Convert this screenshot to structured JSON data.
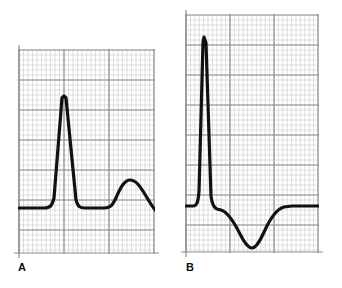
{
  "figure": {
    "background_color": "#ffffff",
    "width": 342,
    "height": 288
  },
  "style": {
    "trace_color": "#111111",
    "trace_width": 3.2,
    "grid_minor_color": "#c9c9c9",
    "grid_major_color": "#8e8e8e",
    "grid_minor_width": 0.6,
    "grid_major_width": 1.2,
    "label_color": "#111111"
  },
  "panels": [
    {
      "id": "panel-a",
      "label": "A",
      "label_x": 18,
      "label_y": 262,
      "box": {
        "x": 19,
        "y": 50,
        "width": 135,
        "height": 203
      },
      "grid": {
        "minor_step_x": 4.5,
        "minor_step_y": 5.0,
        "major_step_x": 45,
        "major_step_y": 30
      },
      "waveform": {
        "name": "normal-qrs-upright-t",
        "baseline_y": 208,
        "r_peak": {
          "x": 64,
          "y": 96
        },
        "t_peak": {
          "x": 128,
          "y": 180
        },
        "path": "M 19,208 L 44,208 C 50,208 52,206 54,198 L 62,98 L 64,96 L 66,98 L 76,200 C 78,207 80,208 85,208 L 104,208 C 110,208 112,206 116,198 C 121,186 125,180 130,180 C 136,180 140,186 146,196 C 150,203 153,208 157,212"
      }
    },
    {
      "id": "panel-b",
      "label": "B",
      "label_x": 186,
      "label_y": 262,
      "box": {
        "x": 186,
        "y": 15,
        "width": 132,
        "height": 237
      },
      "grid": {
        "minor_step_x": 4.4,
        "minor_step_y": 5.0,
        "major_step_x": 44,
        "major_step_y": 30
      },
      "waveform": {
        "name": "tall-r-wave-inverted-t",
        "baseline_y": 206,
        "r_peak": {
          "x": 204,
          "y": 37
        },
        "t_trough": {
          "x": 252,
          "y": 248
        },
        "path": "M 186,206 L 193,206 C 197,206 198,202 199,192 L 203,42 L 204,37 L 206,43 L 211,196 C 212,204 214,208 217,209 L 221,210 C 228,212 234,222 240,234 C 245,244 249,248 252,248 C 256,248 260,241 265,230 C 271,217 277,209 284,207 L 292,206 L 318,206"
      }
    }
  ]
}
